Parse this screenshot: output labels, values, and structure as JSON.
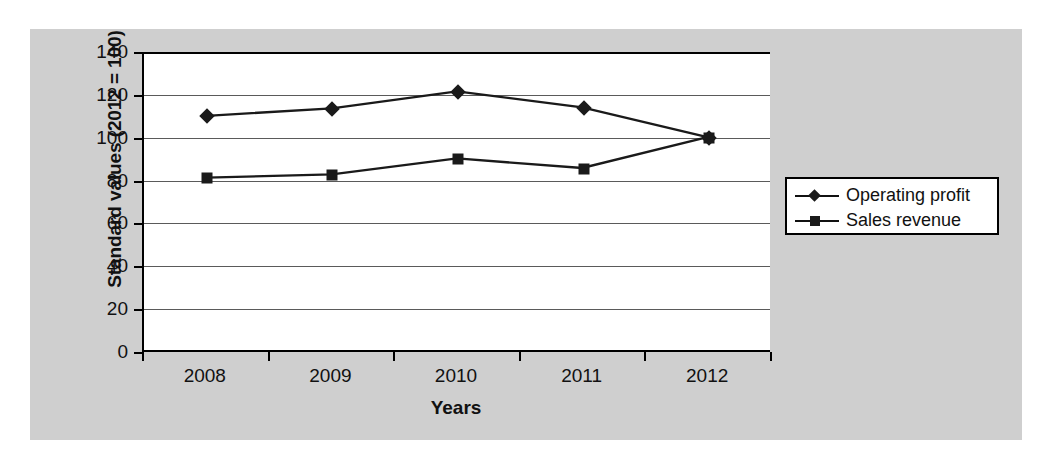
{
  "chart_data": {
    "type": "line",
    "title": "",
    "xlabel": "Years",
    "ylabel": "Standard values (2012 = 100)",
    "categories": [
      "2008",
      "2009",
      "2010",
      "2011",
      "2012"
    ],
    "yticks": [
      0,
      20,
      40,
      60,
      80,
      100,
      120,
      140
    ],
    "ylim": [
      0,
      140
    ],
    "grid": true,
    "legend_position": "right",
    "series": [
      {
        "name": "Operating profit",
        "marker": "diamond",
        "values": [
          110,
          113.5,
          121.5,
          114,
          100
        ]
      },
      {
        "name": "Sales revenue",
        "marker": "square",
        "values": [
          81,
          82.5,
          90,
          85.5,
          100
        ]
      }
    ],
    "colors": {
      "line": "#1a1a1a",
      "gridline": "#5a5a5a",
      "axis": "#000000",
      "plot_background": "#ffffff",
      "figure_background": "#cfcfcf",
      "text": "#111111"
    }
  },
  "legend": {
    "items": [
      {
        "label": "Operating profit",
        "marker": "diamond"
      },
      {
        "label": "Sales revenue",
        "marker": "square"
      }
    ]
  }
}
